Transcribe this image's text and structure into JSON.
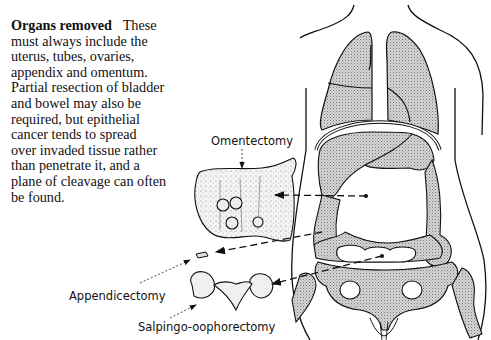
{
  "text": {
    "heading": "Organs removed",
    "lines": [
      "These",
      "must always include the",
      "uterus, tubes, ovaries,",
      "appendix and omentum.",
      "Partial resection of bladder",
      "and bowel may also be",
      "required, but epithelial",
      "cancer tends to spread",
      "over invaded tissue rather",
      "than penetrate it, and a",
      "plane of cleavage can often",
      "be found."
    ]
  },
  "figure": {
    "labels": {
      "omentectomy": "Omentectomy",
      "appendicectomy": "Appendicectomy",
      "salpingo_oophorectomy": "Salpingo-oophorectomy"
    },
    "colors": {
      "ink": "#111111",
      "shade": "#c8c8c8"
    }
  }
}
